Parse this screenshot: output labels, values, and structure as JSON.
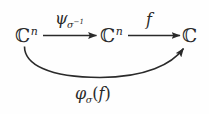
{
  "diagram": {
    "kind": "commutative-diagram",
    "ink_color": "#2a2a2a",
    "background_color": "#fefefe",
    "nodes": [
      {
        "id": "source",
        "base": "ℂ",
        "exponent": "n",
        "text": "ℂⁿ"
      },
      {
        "id": "middle",
        "base": "ℂ",
        "exponent": "n",
        "text": "ℂⁿ"
      },
      {
        "id": "target",
        "base": "ℂ",
        "exponent": "",
        "text": "ℂ"
      }
    ],
    "arrows": [
      {
        "id": "psi-arrow",
        "from": "source",
        "to": "middle",
        "style": "straight",
        "label_plain": "ψ_{σ⁻¹}",
        "label": {
          "main": "ψ",
          "sub_main": "σ",
          "sub_exp": "−1"
        }
      },
      {
        "id": "f-arrow",
        "from": "middle",
        "to": "target",
        "style": "straight",
        "label_plain": "f",
        "label": {
          "main": "f",
          "sub_main": "",
          "sub_exp": ""
        }
      },
      {
        "id": "phi-arrow",
        "from": "source",
        "to": "target",
        "style": "curved-below",
        "label_plain": "φ_σ(f)",
        "label": {
          "main": "φ",
          "sub_main": "σ",
          "open": "(",
          "arg": "f",
          "close": ")"
        }
      }
    ]
  }
}
